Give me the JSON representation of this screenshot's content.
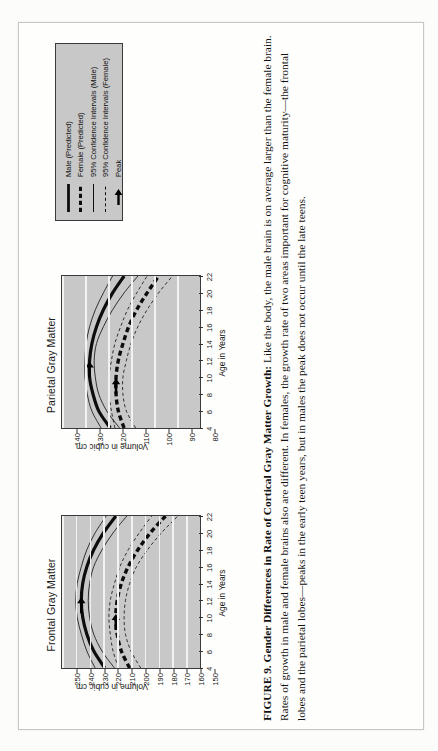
{
  "figure": {
    "caption_label": "FIGURE 9.",
    "caption_title": "Gender Differences in Rate of Cortical Gray Matter Growth:",
    "caption_body": "Like the body, the male brain is on average larger than the female brain. Rates of growth in male and female brains also are different. In females, the growth rate of two areas important for cognitive maturity—the frontal lobes and the parietal lobes—peaks in the early teen years, but in males the peak does not occur until the late teens."
  },
  "legend": {
    "items": [
      {
        "label": "Male (Predicted)",
        "style": "solid-thick"
      },
      {
        "label": "Female (Predicted)",
        "style": "dashed-thick"
      },
      {
        "label": "95% Confidence Intervals (Male)",
        "style": "solid-thin"
      },
      {
        "label": "95% Confidence Intervals (Female)",
        "style": "dashed-thin"
      },
      {
        "label": "Peak",
        "style": "arrow"
      }
    ]
  },
  "chart_data": [
    {
      "type": "line",
      "title": "Frontal Gray Matter",
      "xlabel": "Age in Years",
      "ylabel": "Volume in cubic cm",
      "xlim": [
        4,
        22
      ],
      "ylim": [
        150,
        250
      ],
      "xticks": [
        4,
        6,
        8,
        10,
        12,
        14,
        16,
        18,
        20,
        22
      ],
      "yticks": [
        150,
        160,
        170,
        180,
        190,
        200,
        210,
        220,
        230,
        240,
        250
      ],
      "grid": true,
      "plot_bg": "#c8c8c8",
      "gridline_color": "#f2f2f2",
      "x": [
        4,
        6,
        8,
        10,
        12,
        14,
        16,
        18,
        20,
        22
      ],
      "series": [
        {
          "name": "Male (Predicted)",
          "values": [
            219,
            227,
            232,
            235,
            236,
            235,
            232,
            227,
            220,
            211
          ]
        },
        {
          "name": "Female (Predicted)",
          "values": [
            201,
            207,
            210,
            211,
            210,
            207,
            202,
            195,
            186,
            175
          ]
        },
        {
          "name": "95% Confidence Intervals (Male) upper",
          "values": [
            226,
            232,
            236,
            239,
            240,
            239,
            236,
            232,
            226,
            218
          ]
        },
        {
          "name": "95% Confidence Intervals (Male) lower",
          "values": [
            212,
            221,
            227,
            230,
            231,
            230,
            227,
            221,
            213,
            203
          ]
        },
        {
          "name": "95% Confidence Intervals (Female) upper",
          "values": [
            209,
            213,
            215,
            216,
            215,
            212,
            208,
            202,
            194,
            185
          ]
        },
        {
          "name": "95% Confidence Intervals (Female) lower",
          "values": [
            193,
            200,
            204,
            205,
            204,
            201,
            196,
            188,
            178,
            166
          ]
        }
      ],
      "annotations": [
        {
          "label": "Peak",
          "series": "Male (Predicted)",
          "x": 12.5,
          "y": 236
        },
        {
          "label": "Peak",
          "series": "Female (Predicted)",
          "x": 10.5,
          "y": 211
        }
      ]
    },
    {
      "type": "line",
      "title": "Parietal Gray Matter",
      "xlabel": "Age in Years",
      "ylabel": "Volume in cubic cm",
      "xlim": [
        4,
        22
      ],
      "ylim": [
        80,
        140
      ],
      "xticks": [
        4,
        6,
        8,
        10,
        12,
        14,
        16,
        18,
        20,
        22
      ],
      "yticks": [
        80,
        90,
        100,
        110,
        120,
        130,
        140
      ],
      "grid": true,
      "plot_bg": "#c8c8c8",
      "gridline_color": "#f2f2f2",
      "x": [
        4,
        6,
        8,
        10,
        12,
        14,
        16,
        18,
        20,
        22
      ],
      "series": [
        {
          "name": "Male (Predicted)",
          "values": [
            119,
            124,
            126.5,
            128,
            128,
            127,
            125,
            122,
            118,
            113
          ]
        },
        {
          "name": "Female (Predicted)",
          "values": [
            113,
            115.5,
            116.5,
            116.5,
            115.5,
            113.5,
            111,
            107.5,
            103,
            98
          ]
        },
        {
          "name": "95% Confidence Intervals (Male) upper",
          "values": [
            123,
            127,
            129,
            130,
            130,
            129.5,
            128,
            125.5,
            122,
            118
          ]
        },
        {
          "name": "95% Confidence Intervals (Male) lower",
          "values": [
            115,
            120.5,
            124,
            125.5,
            126,
            125,
            122,
            118,
            113,
            107
          ]
        },
        {
          "name": "95% Confidence Intervals (Female) upper",
          "values": [
            117,
            118.5,
            119.5,
            119.5,
            118.5,
            117,
            114.5,
            111.5,
            107.5,
            103
          ]
        },
        {
          "name": "95% Confidence Intervals (Female) lower",
          "values": [
            108,
            112,
            113.5,
            113.5,
            112,
            110,
            107,
            103,
            98,
            92
          ]
        }
      ],
      "annotations": [
        {
          "label": "Peak",
          "series": "Male (Predicted)",
          "x": 12.0,
          "y": 128
        },
        {
          "label": "Peak",
          "series": "Female (Predicted)",
          "x": 10.0,
          "y": 116.5
        }
      ]
    }
  ]
}
